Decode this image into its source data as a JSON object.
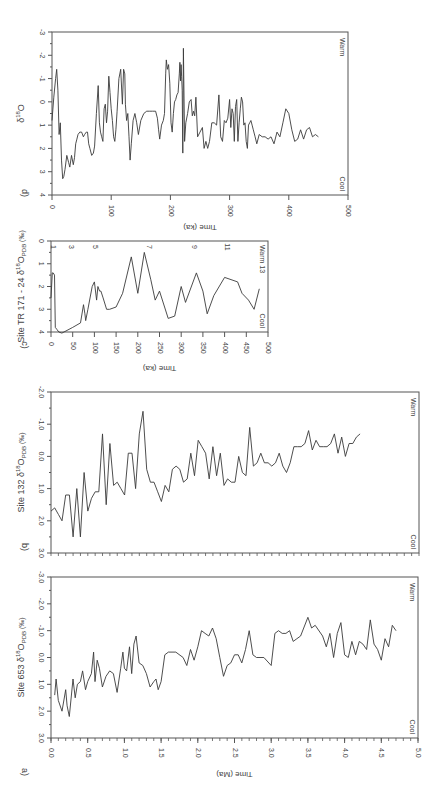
{
  "figure": {
    "width": 445,
    "height": 791,
    "line_color": "#3a3a3a",
    "axis_color": "#555555",
    "warm_label": "Warm",
    "cool_label": "Cool"
  },
  "chart_data": [
    {
      "id": "d",
      "panel_label": "d)",
      "type": "line",
      "title": "",
      "ylabel": "δ18O",
      "ylabel_main": "δ",
      "ylabel_sup": "18",
      "ylabel_tail": "O",
      "xlabel": "Time (ka)",
      "xlim": [
        0,
        500
      ],
      "ylim": [
        4,
        -3
      ],
      "xticks": [
        0,
        100,
        200,
        300,
        400,
        500
      ],
      "yticks": [
        -3,
        -2,
        -1,
        0,
        1,
        2,
        3,
        4
      ],
      "annotations": [
        "Warm",
        "Cool"
      ],
      "px": {
        "x0": 52,
        "x1": 348,
        "y_top": 32,
        "y_bot": 195
      },
      "x": [
        0,
        3,
        6,
        8,
        10,
        12,
        14,
        16,
        18,
        20,
        22,
        25,
        28,
        30,
        33,
        36,
        38,
        40,
        42,
        44,
        47,
        50,
        53,
        55,
        58,
        60,
        62,
        64,
        67,
        70,
        72,
        75,
        78,
        80,
        82,
        84,
        86,
        88,
        90,
        92,
        94,
        96,
        98,
        100,
        102,
        104,
        106,
        108,
        110,
        113,
        116,
        119,
        121,
        123,
        124,
        126,
        128,
        130,
        132,
        134,
        137,
        140,
        143,
        146,
        150,
        155,
        160,
        165,
        170,
        175,
        178,
        180,
        182,
        185,
        188,
        190,
        192,
        193,
        195,
        197,
        199,
        201,
        203,
        205,
        207,
        209,
        211,
        213,
        215,
        216,
        217,
        218,
        219,
        220,
        221,
        222,
        224,
        226,
        229,
        232,
        235,
        237,
        239,
        241,
        243,
        246,
        250,
        254,
        257,
        260,
        263,
        266,
        270,
        274,
        278,
        282,
        285,
        288,
        291,
        294,
        297,
        300,
        302,
        304,
        306,
        308,
        310,
        312,
        314,
        316,
        318,
        320,
        322,
        324,
        326,
        328,
        330,
        332,
        334,
        336,
        338,
        340,
        343,
        346,
        350,
        355,
        360,
        365,
        370,
        375,
        380,
        385,
        390,
        395,
        400,
        405,
        410,
        415,
        420,
        425,
        430,
        435,
        440,
        445,
        450,
        455,
        460
      ],
      "values": [
        0.8,
        -0.2,
        -1.0,
        -1.4,
        -0.5,
        1.4,
        0.9,
        2.5,
        3.3,
        3.2,
        2.9,
        2.3,
        2.6,
        2.8,
        2.3,
        2.7,
        2.4,
        1.8,
        1.6,
        1.4,
        1.3,
        1.3,
        1.5,
        1.4,
        1.3,
        1.3,
        1.8,
        2.0,
        2.3,
        2.2,
        1.9,
        0.5,
        -0.7,
        0.9,
        1.3,
        1.5,
        1.7,
        0.3,
        0.1,
        0.9,
        0.4,
        -1.1,
        -0.4,
        0.3,
        0.8,
        1.5,
        1.7,
        1.2,
        0.4,
        -1.0,
        -1.4,
        0.1,
        -1.4,
        -1.2,
        0.1,
        0.8,
        0.5,
        1.5,
        2.5,
        1.8,
        0.8,
        0.5,
        0.9,
        1.4,
        0.8,
        0.5,
        0.4,
        0.4,
        0.4,
        0.4,
        0.7,
        1.2,
        1.6,
        1.0,
        0.8,
        0.5,
        -1.2,
        -1.8,
        -1.4,
        -1.6,
        -0.8,
        0.9,
        1.3,
        0.5,
        0.0,
        -0.1,
        -0.3,
        -0.4,
        -1.2,
        -1.7,
        -0.9,
        -1.6,
        -1.1,
        -0.5,
        2.2,
        -2.3,
        1.7,
        0.9,
        0.5,
        0.0,
        -0.1,
        0.6,
        0.4,
        0.6,
        -0.2,
        1.5,
        1.3,
        1.1,
        2.0,
        1.7,
        2.0,
        1.7,
        0.9,
        0.9,
        1.0,
        -0.3,
        1.5,
        1.7,
        0.8,
        0.9,
        0.7,
        -0.1,
        1.1,
        0.3,
        0.5,
        1.7,
        0.2,
        -0.1,
        1.7,
        0.9,
        0.3,
        -0.2,
        0.0,
        1.0,
        0.9,
        1.7,
        2.0,
        1.0,
        0.9,
        0.8,
        1.0,
        1.2,
        1.5,
        1.8,
        1.4,
        1.5,
        1.5,
        1.6,
        1.5,
        1.8,
        1.3,
        1.5,
        0.9,
        0.3,
        0.5,
        1.2,
        1.7,
        1.6,
        1.2,
        1.6,
        1.2,
        1.1,
        1.5,
        1.4,
        1.5
      ],
      "values_note": "approximate digitization, higher value = cooler (axis inverted)"
    },
    {
      "id": "c",
      "panel_label": "c)",
      "type": "line",
      "ylabel": "Site TR 171 - 24 δ18OPDB (‰)",
      "ylabel_pre": "Site TR 171 - 24 δ",
      "ylabel_sup": "18",
      "ylabel_mid": "O",
      "ylabel_sub": "PDB",
      "ylabel_tail": " (‰)",
      "xlabel": "Time (ka)",
      "xlim": [
        0,
        500
      ],
      "ylim": [
        4,
        0
      ],
      "xticks": [
        0,
        50,
        100,
        150,
        200,
        250,
        300,
        350,
        400,
        450,
        500
      ],
      "yticks": [
        0,
        1,
        2,
        3,
        4
      ],
      "annotations": [
        "Warm 13",
        "Cool"
      ],
      "stage_labels": [
        {
          "x": 5,
          "label": "1"
        },
        {
          "x": 45,
          "label": "3"
        },
        {
          "x": 100,
          "label": "5"
        },
        {
          "x": 225,
          "label": "7"
        },
        {
          "x": 330,
          "label": "9"
        },
        {
          "x": 405,
          "label": "11"
        },
        {
          "x": 490,
          "label": "13"
        }
      ],
      "px": {
        "x0": 51,
        "x1": 268,
        "y_top": 241,
        "y_bot": 332
      },
      "x": [
        0,
        3,
        5,
        8,
        10,
        14,
        18,
        25,
        50,
        68,
        75,
        78,
        80,
        85,
        95,
        100,
        105,
        108,
        112,
        115,
        120,
        128,
        135,
        150,
        165,
        185,
        200,
        215,
        230,
        240,
        250,
        270,
        285,
        300,
        310,
        335,
        350,
        360,
        375,
        400,
        430,
        440,
        455,
        468,
        480
      ],
      "values": [
        2.5,
        1.4,
        1.4,
        1.5,
        3.8,
        3.9,
        4.0,
        4.05,
        3.8,
        3.6,
        2.8,
        3.2,
        3.5,
        3.0,
        2.0,
        1.8,
        2.6,
        2.0,
        2.2,
        2.2,
        2.5,
        3.0,
        3.0,
        2.9,
        2.3,
        0.7,
        2.3,
        0.5,
        1.7,
        2.6,
        2.2,
        3.4,
        3.3,
        2.0,
        2.7,
        1.4,
        2.2,
        3.2,
        2.4,
        1.6,
        1.8,
        2.3,
        2.6,
        3.0,
        2.1
      ]
    },
    {
      "id": "b",
      "panel_label": "b)",
      "type": "line",
      "ylabel": "Site 132 δ18OPDB (‰)",
      "ylabel_pre": "Site 132 δ",
      "ylabel_sup": "18",
      "ylabel_mid": "O",
      "ylabel_sub": "PDB",
      "ylabel_tail": " (‰)",
      "xlabel": "",
      "xlim": [
        0,
        5
      ],
      "ylim": [
        3.0,
        -2.0
      ],
      "xticks_minor_count": 50,
      "yticks": [
        -2.0,
        -1.0,
        0.0,
        1.0,
        2.0,
        3.0
      ],
      "ytick_labels": [
        "-2.0",
        "-1.0",
        "0.0",
        "1.0",
        "2.0",
        "3.0"
      ],
      "annotations": [
        "Warm",
        "Cool"
      ],
      "px": {
        "x0": 51,
        "x1": 419,
        "y_top": 392,
        "y_bot": 553
      },
      "x": [
        0.0,
        0.05,
        0.1,
        0.15,
        0.2,
        0.25,
        0.3,
        0.35,
        0.4,
        0.45,
        0.5,
        0.55,
        0.6,
        0.65,
        0.7,
        0.75,
        0.8,
        0.85,
        0.9,
        0.95,
        1.0,
        1.05,
        1.1,
        1.15,
        1.2,
        1.25,
        1.3,
        1.35,
        1.4,
        1.45,
        1.5,
        1.55,
        1.6,
        1.65,
        1.7,
        1.75,
        1.8,
        1.85,
        1.9,
        1.95,
        2.0,
        2.05,
        2.1,
        2.15,
        2.2,
        2.25,
        2.3,
        2.35,
        2.4,
        2.45,
        2.5,
        2.55,
        2.6,
        2.65,
        2.7,
        2.75,
        2.8,
        2.85,
        2.9,
        2.95,
        3.0,
        3.05,
        3.1,
        3.15,
        3.2,
        3.25,
        3.3,
        3.35,
        3.4,
        3.45,
        3.5,
        3.55,
        3.6,
        3.65,
        3.7,
        3.75,
        3.8,
        3.85,
        3.9,
        3.95,
        4.0,
        4.05,
        4.1,
        4.15,
        4.2
      ],
      "values": [
        1.7,
        1.6,
        1.8,
        2.0,
        1.2,
        1.2,
        2.5,
        1.0,
        2.5,
        0.5,
        1.7,
        1.3,
        1.1,
        1.1,
        -0.7,
        1.5,
        -0.4,
        0.9,
        0.8,
        1.0,
        1.2,
        -0.1,
        -0.1,
        1.0,
        -0.7,
        -1.4,
        0.4,
        0.8,
        0.8,
        1.1,
        1.4,
        0.9,
        1.1,
        0.4,
        0.3,
        0.4,
        0.8,
        0.7,
        -0.1,
        0.6,
        -0.5,
        -0.3,
        -0.1,
        0.7,
        -0.3,
        0.6,
        -0.1,
        0.9,
        0.7,
        0.8,
        0.8,
        0.0,
        0.5,
        0.6,
        -0.9,
        0.3,
        0.2,
        -0.1,
        0.2,
        0.2,
        0.3,
        0.2,
        -0.1,
        0.3,
        0.5,
        0.2,
        -0.3,
        -0.3,
        -0.3,
        -0.4,
        -0.8,
        -0.2,
        -0.5,
        -0.3,
        -0.3,
        -0.3,
        -0.4,
        -0.7,
        -0.1,
        -0.6,
        0.0,
        -0.4,
        -0.4,
        -0.6,
        -0.7
      ]
    },
    {
      "id": "a",
      "panel_label": "a)",
      "type": "line",
      "ylabel": "Site 653 δ18OPDB (‰)",
      "ylabel_pre": "Site 653 δ",
      "ylabel_sup": "18",
      "ylabel_mid": "O",
      "ylabel_sub": "PDB",
      "ylabel_tail": " (‰)",
      "xlabel": "Time (Ma)",
      "xlim": [
        0,
        5
      ],
      "ylim": [
        3.0,
        -3.0
      ],
      "xticks": [
        0.0,
        0.5,
        1.0,
        1.5,
        2.0,
        2.5,
        3.0,
        3.5,
        4.0,
        4.5,
        5.0
      ],
      "xtick_labels": [
        "0.0",
        "0.5",
        "1.0",
        "1.5",
        "2.0",
        "2.5",
        "3.0",
        "3.5",
        "4.0",
        "4.5",
        "5.0"
      ],
      "yticks": [
        -3.0,
        -2.0,
        -1.0,
        0.0,
        1.0,
        2.0,
        3.0
      ],
      "ytick_labels": [
        "-3.0",
        "-2.0",
        "-1.0",
        "0.0",
        "1.0",
        "2.0",
        "3.0"
      ],
      "annotations": [
        "Warm",
        "Cool"
      ],
      "px": {
        "x0": 51,
        "x1": 418,
        "y_top": 577,
        "y_bot": 738
      },
      "x": [
        0.05,
        0.07,
        0.1,
        0.15,
        0.2,
        0.22,
        0.25,
        0.3,
        0.33,
        0.36,
        0.4,
        0.43,
        0.47,
        0.5,
        0.55,
        0.58,
        0.6,
        0.63,
        0.66,
        0.7,
        0.75,
        0.8,
        0.85,
        0.9,
        0.95,
        0.98,
        1.0,
        1.03,
        1.07,
        1.1,
        1.13,
        1.16,
        1.2,
        1.25,
        1.3,
        1.35,
        1.4,
        1.43,
        1.46,
        1.5,
        1.55,
        1.6,
        1.7,
        1.8,
        1.85,
        1.9,
        1.95,
        2.0,
        2.05,
        2.1,
        2.15,
        2.2,
        2.25,
        2.3,
        2.35,
        2.4,
        2.45,
        2.5,
        2.55,
        2.6,
        2.65,
        2.7,
        2.75,
        2.8,
        2.9,
        3.0,
        3.05,
        3.1,
        3.15,
        3.2,
        3.25,
        3.3,
        3.35,
        3.4,
        3.5,
        3.55,
        3.6,
        3.7,
        3.75,
        3.8,
        3.85,
        3.9,
        3.95,
        4.0,
        4.05,
        4.1,
        4.15,
        4.2,
        4.25,
        4.3,
        4.35,
        4.4,
        4.45,
        4.5,
        4.55,
        4.6,
        4.65,
        4.7
      ],
      "values": [
        1.4,
        0.8,
        1.6,
        2.0,
        1.2,
        1.8,
        2.2,
        0.8,
        1.5,
        1.0,
        0.9,
        0.5,
        1.2,
        0.9,
        0.6,
        -0.2,
        0.9,
        0.1,
        0.4,
        1.1,
        0.7,
        0.5,
        0.6,
        1.3,
        0.4,
        -0.2,
        0.4,
        0.5,
        -0.4,
        0.6,
        -0.5,
        -0.8,
        0.2,
        0.3,
        0.6,
        1.1,
        0.9,
        0.8,
        1.2,
        0.9,
        -0.1,
        -0.2,
        -0.2,
        0.0,
        0.3,
        -0.3,
        0.1,
        -0.4,
        -1.0,
        -0.9,
        -0.8,
        -1.1,
        -0.7,
        0.0,
        0.7,
        0.3,
        0.2,
        -0.1,
        -0.1,
        0.2,
        -0.3,
        -1.0,
        -0.1,
        0.0,
        0.0,
        0.3,
        -0.9,
        -1.0,
        -0.9,
        -0.9,
        -1.0,
        -0.6,
        -0.7,
        -0.8,
        -1.5,
        -1.1,
        -1.2,
        -0.8,
        -0.4,
        -0.9,
        0.0,
        -0.9,
        -1.3,
        -0.1,
        0.0,
        -0.6,
        -0.1,
        -0.6,
        -0.5,
        -0.3,
        -1.4,
        -0.5,
        -0.3,
        0.1,
        -0.7,
        -0.4,
        -1.2,
        -1.0
      ]
    }
  ]
}
